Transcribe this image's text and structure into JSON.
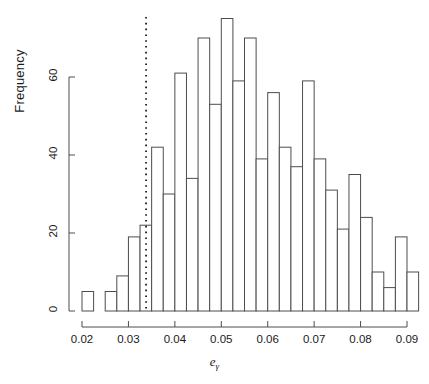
{
  "chart_data": {
    "type": "bar",
    "title": "",
    "subtitle": "",
    "xlabel": "eγ",
    "xlabel_base": "e",
    "xlabel_sub": "γ",
    "ylabel": "Frequency",
    "xlim": [
      0.0195,
      0.0915
    ],
    "ylim": [
      0,
      76
    ],
    "grid": false,
    "legend": null,
    "bin_width": 0.0025,
    "x_ticks": [
      0.02,
      0.03,
      0.04,
      0.05,
      0.06,
      0.07,
      0.08,
      0.09
    ],
    "x_tick_labels": [
      "0.02",
      "0.03",
      "0.04",
      "0.05",
      "0.06",
      "0.07",
      "0.08",
      "0.09"
    ],
    "y_ticks": [
      0,
      20,
      40,
      60
    ],
    "y_tick_labels": [
      "0",
      "20",
      "40",
      "60"
    ],
    "bin_edges": [
      0.02,
      0.0225,
      0.025,
      0.0275,
      0.03,
      0.0325,
      0.035,
      0.0375,
      0.04,
      0.0425,
      0.045,
      0.0475,
      0.05,
      0.0525,
      0.055,
      0.0575,
      0.06,
      0.0625,
      0.065,
      0.0675,
      0.07,
      0.0725,
      0.075,
      0.0775,
      0.08,
      0.0825,
      0.085,
      0.0875,
      0.09,
      0.0925
    ],
    "categories": [
      "0.0200-0.0225",
      "0.0225-0.0250",
      "0.0250-0.0275",
      "0.0275-0.0300",
      "0.0300-0.0325",
      "0.0325-0.0350",
      "0.0350-0.0375",
      "0.0375-0.0400",
      "0.0400-0.0425",
      "0.0425-0.0450",
      "0.0450-0.0475",
      "0.0475-0.0500",
      "0.0500-0.0525",
      "0.0525-0.0550",
      "0.0550-0.0575",
      "0.0575-0.0600",
      "0.0600-0.0625",
      "0.0625-0.0650",
      "0.0650-0.0675",
      "0.0675-0.0700",
      "0.0700-0.0725",
      "0.0725-0.0750",
      "0.0750-0.0775",
      "0.0775-0.0800",
      "0.0800-0.0825",
      "0.0825-0.0850",
      "0.0850-0.0875",
      "0.0875-0.0900",
      "0.0900-0.0925"
    ],
    "values": [
      5,
      0,
      5,
      9,
      19,
      22,
      42,
      30,
      61,
      34,
      70,
      53,
      75,
      59,
      70,
      39,
      56,
      42,
      37,
      59,
      39,
      31,
      21,
      35,
      24,
      10,
      6,
      19,
      10
    ],
    "annotations": [
      {
        "type": "vertical-line",
        "name": "reference-line",
        "x": 0.0338,
        "style": "dotted",
        "color": "#000000"
      }
    ]
  },
  "axis": {
    "y_axis_name": "frequency-axis",
    "x_axis_name": "egamma-axis"
  },
  "colors": {
    "bar_stroke": "#4d4d4d",
    "bar_fill": "#ffffff",
    "axis": "#4d4d4d",
    "text": "#1a1a1a",
    "reference_line": "#000000"
  }
}
